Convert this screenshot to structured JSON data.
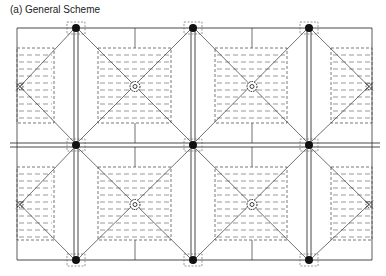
{
  "title": "(a) General Scheme",
  "diagram": {
    "type": "roof drainage / slab panel plan",
    "colors": {
      "line": "#333333",
      "dash": "#555555",
      "node": "#111111"
    },
    "frame": {
      "x1": 17,
      "y1": 28,
      "x2": 372,
      "y2": 260
    },
    "mid_y": 145,
    "double_columns_x": [
      76,
      193,
      309
    ],
    "rows": [
      {
        "top": 28,
        "bottom": 143
      },
      {
        "top": 147,
        "bottom": 260
      }
    ],
    "center_drains": [
      {
        "x": 135,
        "y": 86
      },
      {
        "x": 252,
        "y": 86
      },
      {
        "x": 135,
        "y": 203
      },
      {
        "x": 252,
        "y": 203
      }
    ],
    "edge_drains": [
      {
        "x": 20,
        "y": 86
      },
      {
        "x": 370,
        "y": 86
      },
      {
        "x": 20,
        "y": 203
      },
      {
        "x": 370,
        "y": 203
      }
    ]
  }
}
